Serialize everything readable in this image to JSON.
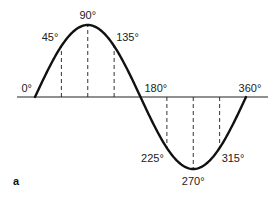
{
  "figure": {
    "panel_label": "a"
  },
  "chart_data": {
    "type": "line",
    "title": "",
    "xlabel": "",
    "ylabel": "",
    "function": "sine",
    "x_range_degrees": [
      0,
      360
    ],
    "y_range": [
      -1,
      1
    ],
    "grid": false,
    "axis_labels": [
      {
        "angle": 0,
        "label": "0°",
        "position": "above-left"
      },
      {
        "angle": 180,
        "label": "180°",
        "position": "above-right"
      },
      {
        "angle": 360,
        "label": "360°",
        "position": "above"
      }
    ],
    "markers": [
      {
        "angle": 45,
        "value": 0.7071,
        "label": "45°",
        "dashed_line": true
      },
      {
        "angle": 90,
        "value": 1.0,
        "label": "90°",
        "dashed_line": true
      },
      {
        "angle": 135,
        "value": 0.7071,
        "label": "135°",
        "dashed_line": true
      },
      {
        "angle": 225,
        "value": -0.7071,
        "label": "225°",
        "dashed_line": true
      },
      {
        "angle": 270,
        "value": -1.0,
        "label": "270°",
        "dashed_line": true
      },
      {
        "angle": 315,
        "value": -0.7071,
        "label": "315°",
        "dashed_line": true
      }
    ],
    "colors": {
      "curve": "#111111",
      "axis": "#222222",
      "dashed": "#333333",
      "text": "#222222"
    }
  }
}
